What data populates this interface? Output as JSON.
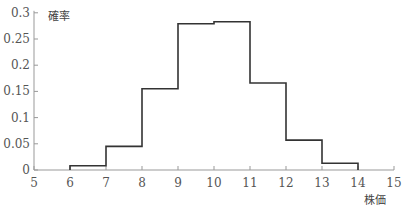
{
  "chart_data": {
    "type": "bar",
    "style": "step-histogram",
    "title": "",
    "xlabel": "株価",
    "ylabel": "確率",
    "x_ticks": [
      5,
      6,
      7,
      8,
      9,
      10,
      11,
      12,
      13,
      14,
      15
    ],
    "y_ticks": [
      "0",
      "0.05",
      "0.1",
      "0.15",
      "0.2",
      "0.25",
      "0.3"
    ],
    "xlim": [
      5,
      15
    ],
    "ylim": [
      0,
      0.3
    ],
    "grid": false,
    "legend": null,
    "bins": [
      {
        "from": 6,
        "to": 7,
        "value": 0.008
      },
      {
        "from": 7,
        "to": 8,
        "value": 0.045
      },
      {
        "from": 8,
        "to": 9,
        "value": 0.155
      },
      {
        "from": 9,
        "to": 10,
        "value": 0.279
      },
      {
        "from": 10,
        "to": 11,
        "value": 0.283
      },
      {
        "from": 11,
        "to": 12,
        "value": 0.166
      },
      {
        "from": 12,
        "to": 13,
        "value": 0.057
      },
      {
        "from": 13,
        "to": 14,
        "value": 0.013
      }
    ],
    "categories": [
      "6-7",
      "7-8",
      "8-9",
      "9-10",
      "10-11",
      "11-12",
      "12-13",
      "13-14"
    ],
    "values": [
      0.008,
      0.045,
      0.155,
      0.279,
      0.283,
      0.166,
      0.057,
      0.013
    ]
  },
  "colors": {
    "line": "#333333",
    "axis": "#999999",
    "text": "#555555"
  }
}
